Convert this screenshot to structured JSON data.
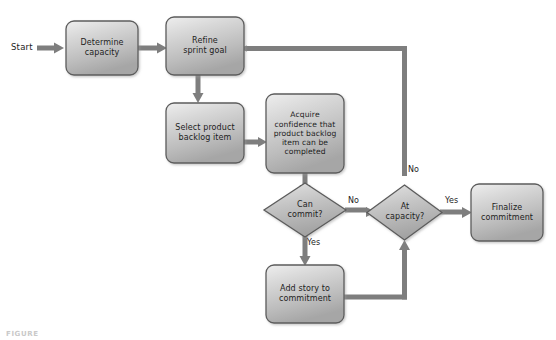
{
  "diagram": {
    "background_color": "#ffffff",
    "node_fill_top": "#e8e8e8",
    "node_fill_bottom": "#a9a9a9",
    "node_stroke": "#5a5a5a",
    "arrow_color": "#7a7a7a",
    "text_color": "#1d1d1d"
  },
  "start": {
    "label": "Start"
  },
  "nodes": [
    {
      "id": "determine-capacity",
      "type": "process",
      "label": "Determine\ncapacity"
    },
    {
      "id": "refine-sprint-goal",
      "type": "process",
      "label": "Refine\nsprint goal"
    },
    {
      "id": "select-backlog-item",
      "type": "process",
      "label": "Select product\nbacklog item"
    },
    {
      "id": "acquire-confidence",
      "type": "process",
      "label": "Acquire\nconfidence that\nproduct backlog\nitem can be\ncompleted"
    },
    {
      "id": "can-commit",
      "type": "decision",
      "label": "Can\ncommit?"
    },
    {
      "id": "at-capacity",
      "type": "decision",
      "label": "At\ncapacity?"
    },
    {
      "id": "add-story",
      "type": "process",
      "label": "Add story to\ncommitment"
    },
    {
      "id": "finalize-commitment",
      "type": "process",
      "label": "Finalize\ncommitment"
    }
  ],
  "edge_labels": {
    "can_commit_no": "No",
    "can_commit_yes": "Yes",
    "at_capacity_no": "No",
    "at_capacity_yes": "Yes"
  },
  "caption": {
    "text": "FIGURE"
  }
}
